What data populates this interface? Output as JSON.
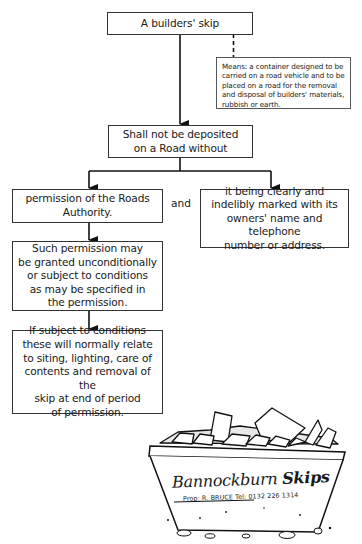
{
  "diagram": {
    "top_box": {
      "text": "A builders' skip"
    },
    "definition_note": {
      "text": "Means: a container designed to be\ncarried on a road vehicle and to be\nplaced on a road for the removal\nand disposal of builders' materials,\nrubbish or earth."
    },
    "rule_box": {
      "text": "Shall not be deposited\non a Road without"
    },
    "left_branch": {
      "permission_box": {
        "text": "permission of the Roads\nAuthority."
      },
      "granted_box": {
        "text": "Such permission may\nbe granted unconditionally\nor subject to conditions\nas may be specified in\nthe permission."
      },
      "conditions_box": {
        "text": "If subject to conditions\nthese will normally relate\nto siting, lighting, care of\ncontents and removal of the\nskip at end of period\nof permission."
      }
    },
    "connector_label": "and",
    "right_branch": {
      "marking_box": {
        "text": "it being clearly and\nindelibly marked with its\nowners' name and telephone\nnumber or address."
      }
    }
  },
  "illustration": {
    "subject": "builders-skip-drawing",
    "brand_word1": "Bannockburn",
    "brand_word2": "Skips",
    "subline": "Prop: R. BRUCE   Tel: 0132 226 1314"
  }
}
